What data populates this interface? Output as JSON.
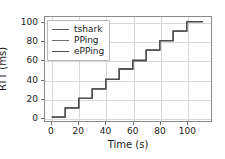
{
  "chart_data": {
    "type": "line",
    "title": "",
    "xlabel": "Time (s)",
    "ylabel": "RTT (ms)",
    "xlim": [
      -5,
      118
    ],
    "ylim": [
      -4,
      106
    ],
    "xticks": [
      0,
      20,
      40,
      60,
      80,
      100
    ],
    "yticks": [
      0,
      20,
      40,
      60,
      80,
      100
    ],
    "grid": true,
    "legend_position": "upper left",
    "drawstyle": "steps-post",
    "x": [
      0,
      10,
      20,
      30,
      40,
      50,
      60,
      70,
      80,
      90,
      100,
      112
    ],
    "series": [
      {
        "name": "tshark",
        "color": "#5a5a5a",
        "values": [
          0,
          10,
          20,
          30,
          40,
          51,
          60,
          71,
          81,
          91,
          101,
          101
        ]
      },
      {
        "name": "PPing",
        "color": "#6e6e6e",
        "values": [
          0,
          10,
          20,
          30,
          40,
          51,
          60,
          71,
          81,
          91,
          101,
          101
        ]
      },
      {
        "name": "ePPing",
        "color": "#4e4e4e",
        "values": [
          0,
          10,
          20,
          30,
          40,
          51,
          60,
          71,
          81,
          91,
          101,
          101
        ]
      }
    ]
  },
  "legend": {
    "entries": [
      {
        "label": "tshark"
      },
      {
        "label": "PPing"
      },
      {
        "label": "ePPing"
      }
    ]
  },
  "axes": {
    "xtick_labels": [
      "0",
      "20",
      "40",
      "60",
      "80",
      "100"
    ],
    "ytick_labels": [
      "0",
      "20",
      "40",
      "60",
      "80",
      "100"
    ],
    "xlabel": "Time (s)",
    "ylabel": "RTT (ms)"
  }
}
